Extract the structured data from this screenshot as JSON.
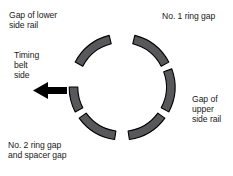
{
  "diagram": {
    "colors": {
      "arc_fill": "#58585a",
      "arc_stroke": "#000000",
      "arrow_fill": "#000000",
      "text": "#1a1a1a",
      "background": "#ffffff"
    },
    "circle": {
      "center_x": 122,
      "center_y": 87,
      "radius": 53,
      "segment_count": 6
    },
    "segments": [
      {
        "name": "segment-no1-ring-gap-to-upper-rail",
        "start_deg": -76,
        "end_deg": -28
      },
      {
        "name": "segment-upper-rail-to-lower-right",
        "start_deg": -20,
        "end_deg": 28
      },
      {
        "name": "segment-lower-right-to-bottom",
        "start_deg": 36,
        "end_deg": 82
      },
      {
        "name": "segment-bottom-to-no2-ring-gap",
        "start_deg": 98,
        "end_deg": 144
      },
      {
        "name": "segment-no2-ring-gap-to-timing-belt",
        "start_deg": 152,
        "end_deg": 200
      },
      {
        "name": "segment-timing-belt-to-top",
        "start_deg": 208,
        "end_deg": 256
      }
    ],
    "labels": {
      "lower_side_rail": "Gap of lower\nside rail",
      "no1_ring_gap": "No. 1 ring gap",
      "timing_belt_side": "Timing\nbelt\nside",
      "upper_side_rail": "Gap of\nupper\nside rail",
      "no2_ring_gap": "No. 2 ring gap\nand spacer gap"
    },
    "arrow": {
      "name": "timing-belt-direction-arrow",
      "direction": "left",
      "x": 33,
      "y": 82,
      "width": 34,
      "height": 17
    }
  }
}
